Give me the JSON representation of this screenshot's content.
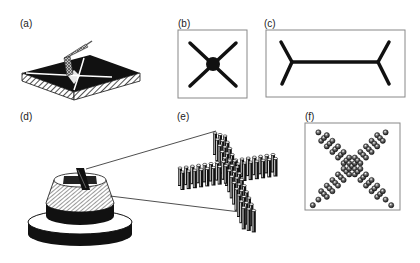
{
  "panels": {
    "a": {
      "label": "(a)",
      "description": "tilted slab with crossed groove, stylus/tool above"
    },
    "b": {
      "label": "(b)",
      "description": "X shape with central dot"
    },
    "c": {
      "label": "(c)",
      "description": "double-Y shape connected by horizontal bar"
    },
    "d": {
      "label": "(d)",
      "description": "stacked cylinder pedestal with X-shaped pattern on top"
    },
    "e": {
      "label": "(e)",
      "description": "magnified X-shaped array of pillars"
    },
    "f": {
      "label": "(f)",
      "description": "top view of X-shaped array of spheres"
    }
  },
  "colors": {
    "ink": "#111111",
    "frame": "#888888",
    "background": "#ffffff",
    "hatch": "#333333"
  }
}
